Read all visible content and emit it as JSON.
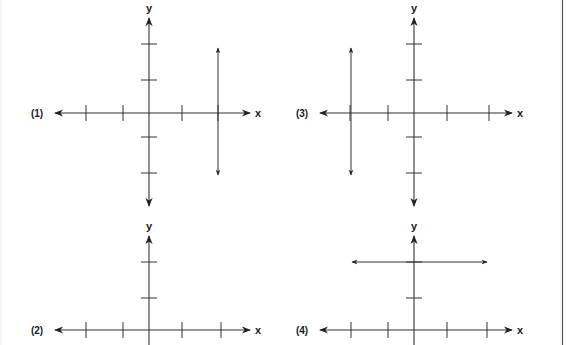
{
  "figure": {
    "border_color": "#555555",
    "line_color": "#333333",
    "panels": [
      {
        "id": 1,
        "label": "(1)",
        "x_axis_label": "x",
        "y_axis_label": "y",
        "origin": [
          149,
          113
        ],
        "x_axis": {
          "y": 113,
          "x_left": 55,
          "x_right": 250,
          "ticks": [
            86,
            123,
            182,
            218
          ]
        },
        "y_axis": {
          "x": 149,
          "y_top": 18,
          "y_bottom": 206,
          "ticks": [
            44,
            80,
            137,
            173
          ]
        },
        "graph": {
          "type": "vertical_line",
          "x": 218,
          "y1": 48,
          "y2": 175,
          "description": "x = 2"
        }
      },
      {
        "id": 2,
        "label": "(2)",
        "x_axis_label": "x",
        "y_axis_label": "y",
        "origin": [
          149,
          330
        ],
        "x_axis": {
          "y": 330,
          "x_left": 55,
          "x_right": 250,
          "ticks": [
            86,
            123,
            182,
            221
          ]
        },
        "y_axis": {
          "x": 149,
          "y_top": 236,
          "y_bottom": 345,
          "ticks": [
            262,
            298
          ]
        },
        "graph": null
      },
      {
        "id": 3,
        "label": "(3)",
        "x_axis_label": "x",
        "y_axis_label": "y",
        "origin": [
          414,
          113
        ],
        "x_axis": {
          "y": 113,
          "x_left": 320,
          "x_right": 512,
          "ticks": [
            350,
            388,
            447,
            489
          ]
        },
        "y_axis": {
          "x": 414,
          "y_top": 18,
          "y_bottom": 206,
          "ticks": [
            44,
            80,
            137,
            173
          ]
        },
        "graph": {
          "type": "vertical_line",
          "x": 351,
          "y1": 48,
          "y2": 175,
          "description": "x = -2"
        }
      },
      {
        "id": 4,
        "label": "(4)",
        "x_axis_label": "x",
        "y_axis_label": "y",
        "origin": [
          414,
          330
        ],
        "x_axis": {
          "y": 330,
          "x_left": 320,
          "x_right": 512,
          "ticks": [
            351,
            388,
            447,
            487
          ]
        },
        "y_axis": {
          "x": 414,
          "y_top": 236,
          "y_bottom": 345,
          "ticks": [
            262,
            298
          ]
        },
        "graph": {
          "type": "horizontal_line",
          "y": 262,
          "x1": 352,
          "x2": 487,
          "description": "y = 2"
        }
      }
    ]
  }
}
